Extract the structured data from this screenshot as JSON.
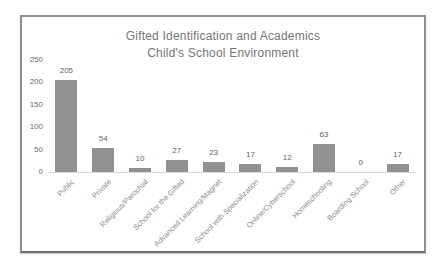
{
  "colors": {
    "border_color": "#8e8e8e",
    "title_color": "#767676",
    "bar_color": "#929292",
    "tick_color": "#6e6e6e",
    "value_label_color": "#636363",
    "cat_label_color": "#8a8a8a",
    "axis_line_color": "#d9d9d9"
  },
  "chart_data": {
    "type": "bar",
    "title": "Gifted Identification and Academics",
    "subtitle": "Child's School Environment",
    "categories": [
      "Public",
      "Private",
      "Religious/Parochial",
      "School for the Gifted",
      "Advanced Learning/Magnet",
      "School with Specialization",
      "Online/Cyberschool",
      "Homeschooling",
      "Boarding School",
      "Other"
    ],
    "values": [
      205,
      54,
      10,
      27,
      23,
      17,
      12,
      63,
      0,
      17
    ],
    "xlabel": "",
    "ylabel": "",
    "ylim": [
      0,
      250
    ],
    "yticks": [
      0,
      50,
      100,
      150,
      200,
      250
    ],
    "grid": false,
    "legend": false,
    "data_labels": true,
    "x_label_rotation_deg": 45
  }
}
